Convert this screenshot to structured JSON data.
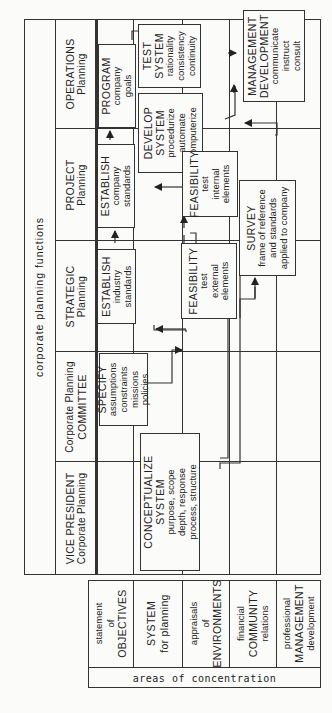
{
  "diagram": {
    "title": "corporate planning functions",
    "columns": [
      {
        "id": "vp",
        "line1": "VICE PRESIDENT",
        "line2": "Corporate Planning"
      },
      {
        "id": "cpc",
        "line1": "Corporate Planning",
        "line2": "COMMITTEE"
      },
      {
        "id": "strategic",
        "line1": "STRATEGIC",
        "line2": "Planning"
      },
      {
        "id": "project",
        "line1": "PROJECT",
        "line2": "Planning"
      },
      {
        "id": "operations",
        "line1": "OPERATIONS",
        "line2": "Planning"
      }
    ],
    "rows_label": "areas of concentration",
    "rows": [
      {
        "id": "objectives",
        "line1": "statement",
        "line2": "of",
        "line3": "OBJECTIVES"
      },
      {
        "id": "system",
        "line1": "SYSTEM",
        "line2": "for planning",
        "line3": ""
      },
      {
        "id": "environments",
        "line1": "appraisals",
        "line2": "of",
        "line3": "ENVIRONMENTS"
      },
      {
        "id": "community",
        "line1": "financial",
        "line2": "COMMUNITY",
        "line3": "relations"
      },
      {
        "id": "management",
        "line1": "professional",
        "line2": "MANAGEMENT",
        "line3": "development"
      }
    ],
    "boxes": {
      "specify": {
        "title": "SPECIFY",
        "lines": [
          "assumptions",
          "constraints",
          "missions",
          "policies"
        ]
      },
      "conceptualize": {
        "title": "CONCEPTUALIZE",
        "title2": "SYSTEM",
        "lines": [
          "purpose, scope",
          "depth, response",
          "process, structure"
        ]
      },
      "establish_industry": {
        "title": "ESTABLISH",
        "lines": [
          "industry",
          "standards"
        ]
      },
      "establish_company": {
        "title": "ESTABLISH",
        "lines": [
          "company",
          "standards"
        ]
      },
      "program": {
        "title": "PROGRAM",
        "lines": [
          "company",
          "goals"
        ]
      },
      "develop": {
        "title": "DEVELOP",
        "title2": "SYSTEM",
        "lines": [
          "procedurize",
          "automate",
          "computerize"
        ]
      },
      "test": {
        "title": "TEST",
        "title2": "SYSTEM",
        "lines": [
          "rationality",
          "consistency",
          "continuity"
        ]
      },
      "feasibility_internal": {
        "title": "FEASIBILITY",
        "lines": [
          "test",
          "internal",
          "elements"
        ]
      },
      "feasibility_external": {
        "title": "FEASIBILITY",
        "lines": [
          "test",
          "external",
          "elements"
        ]
      },
      "survey": {
        "title": "SURVEY",
        "lines": [
          "frame of reference",
          "and standards",
          "applied to company"
        ]
      },
      "mgmt_dev": {
        "title": "MANAGEMENT",
        "title2": "DEVELOPMENT",
        "lines": [
          "communicate",
          "instruct",
          "consult"
        ]
      }
    }
  }
}
